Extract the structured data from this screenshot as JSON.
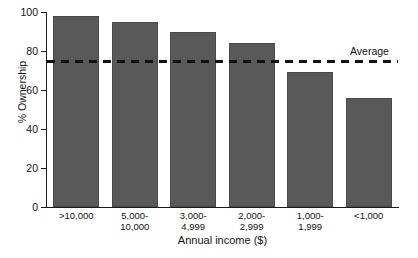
{
  "chart_data": {
    "type": "bar",
    "title": "",
    "xlabel": "Annual income ($)",
    "ylabel": "% Ownership",
    "categories": [
      ">10,000",
      "5,000-\n10,000",
      "3,000-\n4,999",
      "2,000-\n2,999",
      "1,000-\n1,999",
      "<1,000"
    ],
    "values": [
      98,
      95,
      90,
      84,
      69,
      56
    ],
    "ylim": [
      0,
      100
    ],
    "yticks": [
      0,
      20,
      40,
      60,
      80,
      100
    ],
    "ytick_labels": [
      "0",
      "20",
      "40",
      "60",
      "80",
      "100"
    ],
    "grid": false,
    "legend": "none",
    "bar_color": "#595959",
    "annotations": [
      {
        "name": "average-line",
        "label": "Average",
        "value": 74.5,
        "style": "dashed",
        "color": "#111111"
      }
    ]
  },
  "axes": {
    "y_title": "% Ownership",
    "x_title": "Annual income ($)"
  }
}
